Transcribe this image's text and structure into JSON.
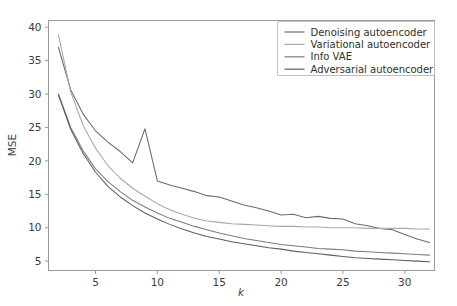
{
  "chart_data": {
    "type": "line",
    "title": "",
    "xlabel": "k",
    "ylabel": "MSE",
    "xlim": [
      1.2,
      32.4
    ],
    "ylim": [
      3.6,
      41.0
    ],
    "xticks": [
      5,
      10,
      15,
      20,
      25,
      30
    ],
    "yticks": [
      5,
      10,
      15,
      20,
      25,
      30,
      35,
      40
    ],
    "grid": false,
    "legend_position": "upper right",
    "x": [
      2,
      3,
      4,
      5,
      6,
      7,
      8,
      9,
      10,
      11,
      12,
      13,
      14,
      15,
      16,
      17,
      18,
      19,
      20,
      21,
      22,
      23,
      24,
      25,
      26,
      27,
      28,
      29,
      30,
      31,
      32
    ],
    "series": [
      {
        "name": "Denoising autoencoder",
        "color": "#6b6b6b",
        "values": [
          37.0,
          30.6,
          27.0,
          24.5,
          22.8,
          21.4,
          19.7,
          24.8,
          17.0,
          16.4,
          15.9,
          15.4,
          14.8,
          14.6,
          14.0,
          13.4,
          13.0,
          12.5,
          11.9,
          12.0,
          11.5,
          11.7,
          11.4,
          11.3,
          10.6,
          10.3,
          9.9,
          9.7,
          9.0,
          8.3,
          7.8
        ]
      },
      {
        "name": "Variational autoencoder",
        "color": "#a8a8a8",
        "values": [
          38.9,
          30.3,
          25.3,
          21.9,
          19.3,
          17.4,
          15.9,
          14.7,
          13.6,
          12.7,
          12.0,
          11.4,
          11.0,
          10.8,
          10.6,
          10.5,
          10.4,
          10.3,
          10.2,
          10.2,
          10.1,
          10.1,
          10.0,
          10.0,
          10.0,
          9.9,
          9.9,
          9.9,
          9.9,
          9.8,
          9.8
        ]
      },
      {
        "name": "Info VAE",
        "color": "#7d7d7d",
        "values": [
          30.0,
          25.0,
          21.5,
          18.8,
          16.9,
          15.4,
          14.1,
          13.1,
          12.2,
          11.4,
          10.8,
          10.2,
          9.7,
          9.2,
          8.8,
          8.4,
          8.1,
          7.8,
          7.5,
          7.3,
          7.1,
          6.9,
          6.8,
          6.7,
          6.5,
          6.4,
          6.3,
          6.2,
          6.1,
          6.0,
          5.9
        ]
      },
      {
        "name": "Adversarial autoencoder",
        "color": "#5e5e5e",
        "values": [
          29.9,
          24.7,
          21.1,
          18.3,
          16.2,
          14.6,
          13.3,
          12.2,
          11.3,
          10.5,
          9.8,
          9.2,
          8.7,
          8.3,
          7.9,
          7.6,
          7.3,
          7.0,
          6.8,
          6.5,
          6.3,
          6.1,
          5.9,
          5.7,
          5.5,
          5.4,
          5.3,
          5.2,
          5.1,
          5.0,
          4.9
        ]
      }
    ]
  },
  "legend": {
    "entries": [
      "Denoising autoencoder",
      "Variational autoencoder",
      "Info VAE",
      "Adversarial autoencoder"
    ]
  },
  "axes": {
    "ylabel": "MSE",
    "xlabel": "k",
    "xtick_labels": [
      "5",
      "10",
      "15",
      "20",
      "25",
      "30"
    ],
    "ytick_labels": [
      "5",
      "10",
      "15",
      "20",
      "25",
      "30",
      "35",
      "40"
    ]
  }
}
